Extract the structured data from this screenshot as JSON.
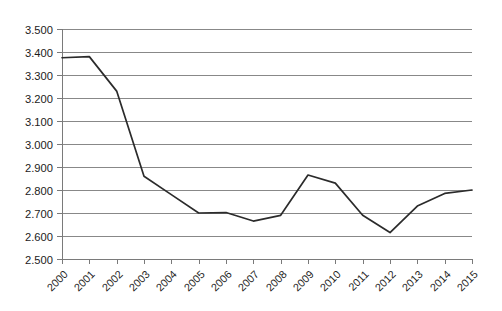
{
  "chart_data": {
    "type": "line",
    "title": "",
    "subtitle": "",
    "xlabel": "",
    "ylabel": "",
    "categories": [
      "2000",
      "2001",
      "2002",
      "2003",
      "2004",
      "2005",
      "2006",
      "2007",
      "2008",
      "2009",
      "2010",
      "2011",
      "2012",
      "2013",
      "2014",
      "2015"
    ],
    "values": [
      3.375,
      3.38,
      3.23,
      2.86,
      2.78,
      2.7,
      2.702,
      2.665,
      2.69,
      2.865,
      2.83,
      2.69,
      2.615,
      2.73,
      2.785,
      2.8
    ],
    "series": [
      {
        "name": "Series 1",
        "values": [
          3.375,
          3.38,
          3.23,
          2.86,
          2.78,
          2.7,
          2.702,
          2.665,
          2.69,
          2.865,
          2.83,
          2.69,
          2.615,
          2.73,
          2.785,
          2.8
        ]
      }
    ],
    "ylim": [
      2.5,
      3.5
    ],
    "ytick_step": 0.1,
    "ytick_labels": [
      "3.500",
      "3.400",
      "3.300",
      "3.200",
      "3.100",
      "3.000",
      "2.900",
      "2.800",
      "2.700",
      "2.600",
      "2.500"
    ],
    "ytick_values": [
      3.5,
      3.4,
      3.3,
      3.2,
      3.1,
      3.0,
      2.9,
      2.8,
      2.7,
      2.6,
      2.5
    ],
    "xtick_labels": [
      "2000",
      "2001",
      "2002",
      "2003",
      "2004",
      "2005",
      "2006",
      "2007",
      "2008",
      "2009",
      "2010",
      "2011",
      "2012",
      "2013",
      "2014",
      "2015"
    ],
    "xtick_rotation_deg": 45,
    "grid": true,
    "grid_axis": "y",
    "legend": false,
    "legend_position": "none",
    "line_color": "#2b2b2b",
    "grid_color": "#888888",
    "axis_color": "#7a7a7a",
    "background_color": "#ffffff",
    "annotations": []
  },
  "caption": {
    "text": ""
  }
}
